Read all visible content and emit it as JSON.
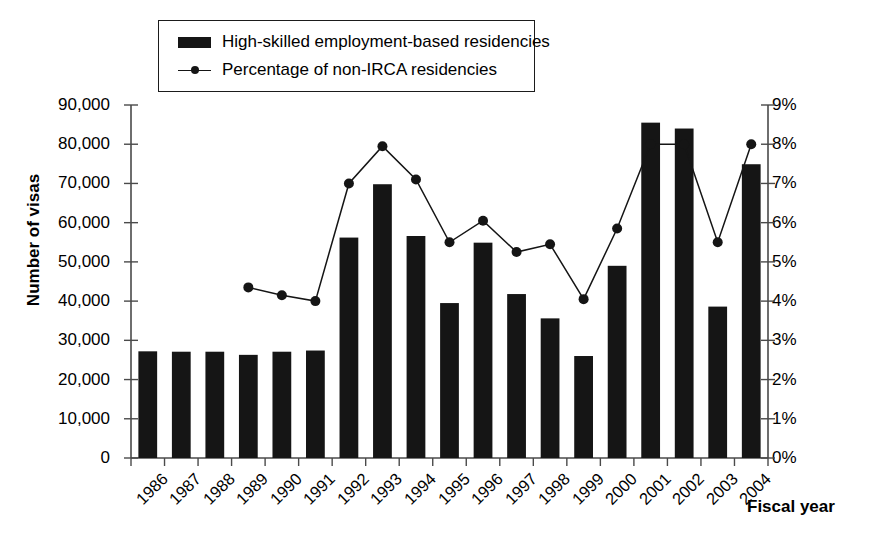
{
  "chart_data": {
    "type": "bar",
    "title": "",
    "xlabel": "Fiscal year",
    "ylabel": "Number of visas",
    "ylabel_secondary": "",
    "grid": false,
    "legend_position": "top-left-inside",
    "categories": [
      "1986",
      "1987",
      "1988",
      "1989",
      "1990",
      "1991",
      "1992",
      "1993",
      "1994",
      "1995",
      "1996",
      "1997",
      "1998",
      "1999",
      "2000",
      "2001",
      "2002",
      "2003",
      "2004"
    ],
    "ylim": [
      0,
      90000
    ],
    "ylim_secondary": [
      0,
      9
    ],
    "yticks": [
      "0",
      "10,000",
      "20,000",
      "30,000",
      "40,000",
      "50,000",
      "60,000",
      "70,000",
      "80,000",
      "90,000"
    ],
    "ytick_values": [
      0,
      10000,
      20000,
      30000,
      40000,
      50000,
      60000,
      70000,
      80000,
      90000
    ],
    "yticks_secondary": [
      "0%",
      "1%",
      "2%",
      "3%",
      "4%",
      "5%",
      "6%",
      "7%",
      "8%",
      "9%"
    ],
    "ytick_values_secondary": [
      0,
      1,
      2,
      3,
      4,
      5,
      6,
      7,
      8,
      9
    ],
    "series": [
      {
        "name": "High-skilled employment-based residencies",
        "type": "bar",
        "axis": "left",
        "color": "#151515",
        "values": [
          27200,
          27100,
          27100,
          26300,
          27100,
          27400,
          56200,
          69800,
          56600,
          39500,
          54900,
          41800,
          35600,
          26000,
          49000,
          85500,
          84000,
          38600,
          74900
        ]
      },
      {
        "name": "Percentage of non-IRCA residencies",
        "type": "line",
        "axis": "right",
        "color": "#151515",
        "values": [
          null,
          null,
          null,
          4.35,
          4.15,
          4.0,
          7.0,
          7.95,
          7.1,
          5.5,
          6.05,
          5.25,
          5.45,
          4.05,
          5.85,
          8.0,
          8.0,
          5.5,
          8.0
        ]
      }
    ]
  },
  "legend": {
    "items": [
      {
        "label": "High-skilled employment-based residencies",
        "marker": "bar-swatch"
      },
      {
        "label": "Percentage of non-IRCA residencies",
        "marker": "line-marker-swatch"
      }
    ]
  },
  "axes": {
    "left_title": "Number of visas",
    "bottom_title": "Fiscal year"
  },
  "colors": {
    "series": "#151515",
    "axis": "#4a4a4a",
    "background": "#ffffff"
  }
}
